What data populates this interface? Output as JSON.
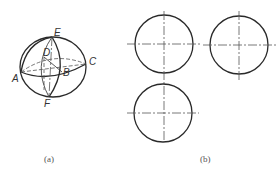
{
  "figure_a": {
    "caption": "(a)",
    "points": {
      "A": "A",
      "B": "B",
      "C": "C",
      "D": "D",
      "E": "E",
      "F": "F"
    }
  },
  "figure_b": {
    "caption": "(b)",
    "views": [
      "front-view",
      "side-view",
      "top-view"
    ]
  },
  "colors": {
    "line": "#2a2a2a",
    "centerline": "#555555",
    "background": "#ffffff"
  }
}
